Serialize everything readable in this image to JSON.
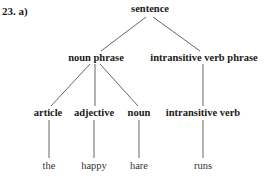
{
  "problem_label": "23. a)",
  "tree": {
    "root": "sentence",
    "level1": {
      "noun_phrase": "noun phrase",
      "verb_phrase": "intransitive verb phrase"
    },
    "level2": {
      "article": "article",
      "adjective": "adjective",
      "noun": "noun",
      "intransitive_verb": "intransitive verb"
    },
    "leaves": {
      "article": "the",
      "adjective": "happy",
      "noun": "hare",
      "intransitive_verb": "runs"
    }
  }
}
